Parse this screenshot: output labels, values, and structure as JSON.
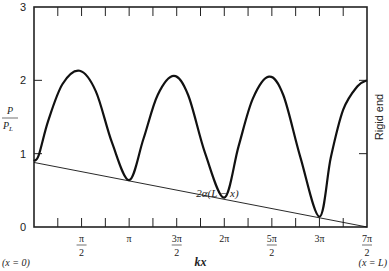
{
  "chart_data": {
    "type": "line",
    "title": "",
    "xlabel": "kx",
    "ylabel_num": "P",
    "ylabel_den": "P_L",
    "xlim": [
      0,
      3.5
    ],
    "x_unit": "pi",
    "ylim": [
      0,
      3
    ],
    "grid": false,
    "y_ticks": [
      {
        "value": 0,
        "label": "0"
      },
      {
        "value": 1,
        "label": "1"
      },
      {
        "value": 2,
        "label": "2"
      },
      {
        "value": 3,
        "label": "3"
      }
    ],
    "x_ticks_pi": [
      0.25,
      0.5,
      0.75,
      1,
      1.25,
      1.5,
      1.75,
      2,
      2.25,
      2.5,
      2.75,
      3,
      3.25,
      3.5
    ],
    "x_tick_labels": [
      {
        "value": 0.5,
        "num": "π",
        "den": "2"
      },
      {
        "value": 1,
        "num": "π",
        "den": ""
      },
      {
        "value": 1.5,
        "num": "3π",
        "den": "2"
      },
      {
        "value": 2,
        "num": "2π",
        "den": ""
      },
      {
        "value": 2.5,
        "num": "5π",
        "den": "2"
      },
      {
        "value": 3,
        "num": "3π",
        "den": ""
      },
      {
        "value": 3.5,
        "num": "7π",
        "den": "2"
      }
    ],
    "series": [
      {
        "name": "P/P_L",
        "style": "thick",
        "x_pi": [
          0,
          0.05,
          0.15,
          0.3,
          0.48,
          0.65,
          0.82,
          1.0,
          1.15,
          1.3,
          1.47,
          1.62,
          1.8,
          2.0,
          2.15,
          2.3,
          2.47,
          2.62,
          2.8,
          3.0,
          3.12,
          3.25,
          3.4,
          3.5
        ],
        "y": [
          0.9,
          0.98,
          1.45,
          1.95,
          2.13,
          1.85,
          1.15,
          0.64,
          1.2,
          1.8,
          2.06,
          1.8,
          1.0,
          0.4,
          1.1,
          1.75,
          2.05,
          1.8,
          0.95,
          0.14,
          0.95,
          1.6,
          1.92,
          2.0
        ]
      },
      {
        "name": "2α(L − x)",
        "style": "thin",
        "x_pi": [
          0,
          3.5
        ],
        "y": [
          0.88,
          0.0
        ]
      }
    ],
    "annotations": [
      {
        "text": "2α(L − x)",
        "x_pi": 2.0,
        "y": 0.47
      },
      {
        "text": "Rigid end",
        "position": "right",
        "rotated": true
      },
      {
        "text": "(x = 0)",
        "position": "bottom-left"
      },
      {
        "text": "(x = L)",
        "position": "bottom-right"
      }
    ]
  }
}
